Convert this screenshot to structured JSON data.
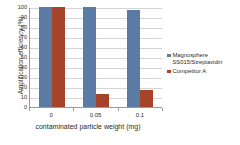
{
  "chart_data": {
    "type": "bar",
    "title": "",
    "categories": [
      "0",
      "0.05",
      "0.1"
    ],
    "series": [
      {
        "name": "Magnosphere\nSS015/Streptavidin",
        "color": "#5b7ba5",
        "values": [
          100,
          100,
          97
        ]
      },
      {
        "name": "Competitor A",
        "color": "#a5432b",
        "values": [
          100,
          13,
          17
        ]
      }
    ],
    "xlabel": "contaminated particle weight\n(mg)",
    "ylabel": "Amplification efficiency (%)",
    "ylim": [
      0,
      100
    ],
    "ytick_labels": [
      "100",
      "90",
      "80",
      "70",
      "60",
      "50",
      "40",
      "30",
      "20",
      "10",
      "0"
    ],
    "ytick_values": [
      100,
      90,
      80,
      70,
      60,
      50,
      40,
      30,
      20,
      10,
      0
    ],
    "grid": true,
    "legend_position": "right"
  },
  "axes": {
    "y_title": "Amplification efficiency (%)",
    "x_title": "contaminated particle weight\n(mg)"
  },
  "legend": {
    "items": [
      {
        "label": "Magnosphere\nSS015/Streptavidin",
        "color": "#5b7ba5"
      },
      {
        "label": "Competitor A",
        "color": "#a5432b"
      }
    ]
  }
}
